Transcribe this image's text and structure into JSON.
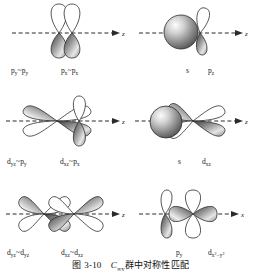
{
  "figure": {
    "caption_prefix": "图",
    "caption_number": "3-10",
    "caption_group": "C",
    "caption_group_sub": "∞v",
    "caption_text": "群中对称性匹配",
    "caption_full": "图 3-10  C∞v群中对称性匹配"
  },
  "colors": {
    "ink": "#1a1a1a",
    "outline": "#2b2b2b",
    "shade_dark": "#3a3a3a",
    "shade_mid": "#8d8d8d",
    "shade_light": "#e8e8e8",
    "sphere_dark": "#4a4a4a",
    "sphere_light": "#f2f2f2",
    "axis": "#2b2b2b",
    "background": "#ffffff"
  },
  "panels": [
    {
      "id": "panel-1",
      "row": 1,
      "col": 1,
      "axis_label": "z",
      "axis_style": "dashed-arrow-right",
      "orbitals": [
        "p_y vertical",
        "p_x vertical"
      ],
      "labels": [
        {
          "base": "p",
          "sub": "y",
          "tilde": "~",
          "base2": "p",
          "sub2": "y",
          "text": "py~py"
        },
        {
          "base": "p",
          "sub": "x",
          "tilde": "~",
          "base2": "p",
          "sub2": "x",
          "text": "px~px"
        }
      ],
      "label_texts": [
        "p",
        "y",
        "~",
        "p",
        "y",
        "p",
        "x",
        "~",
        "p",
        "x"
      ]
    },
    {
      "id": "panel-2",
      "row": 1,
      "col": 2,
      "axis_label": "z",
      "axis_style": "dashed-arrow-right",
      "orbitals": [
        "s sphere",
        "p_z tilted"
      ],
      "labels": [
        {
          "base": "s",
          "sub": "",
          "text": "s"
        },
        {
          "base": "p",
          "sub": "z",
          "text": "pz"
        }
      ]
    },
    {
      "id": "panel-3",
      "row": 2,
      "col": 1,
      "axis_label": "z",
      "axis_style": "dashed-arrow-right",
      "orbitals": [
        "d_yz four lobe",
        "p_y vertical"
      ],
      "labels": [
        {
          "base": "d",
          "sub": "yz",
          "tilde": "~",
          "base2": "p",
          "sub2": "y",
          "text": "dyz~py"
        },
        {
          "base": "d",
          "sub": "xz",
          "tilde": "~",
          "base2": "p",
          "sub2": "x",
          "text": "dxz~px"
        }
      ]
    },
    {
      "id": "panel-4",
      "row": 2,
      "col": 2,
      "axis_label": "z",
      "axis_style": "dashed-arrow-right",
      "orbitals": [
        "s sphere",
        "d_xz four lobe"
      ],
      "labels": [
        {
          "base": "s",
          "sub": "",
          "text": "s"
        },
        {
          "base": "d",
          "sub": "xz",
          "text": "dxz"
        }
      ]
    },
    {
      "id": "panel-5",
      "row": 3,
      "col": 1,
      "axis_label": "z",
      "axis_style": "dashed-arrow-right",
      "orbitals": [
        "d_yz four lobe",
        "d_yz four lobe"
      ],
      "labels": [
        {
          "base": "d",
          "sub": "yz",
          "tilde": "~",
          "base2": "d",
          "sub2": "yz",
          "text": "dyz~dyz"
        },
        {
          "base": "d",
          "sub": "xz",
          "tilde": "~",
          "base2": "d",
          "sub2": "xz",
          "text": "dxz~dxz"
        }
      ]
    },
    {
      "id": "panel-6",
      "row": 3,
      "col": 2,
      "axis_label": "x",
      "axis_style": "dashed-arrow-right",
      "orbitals": [
        "p_y vertical",
        "d_x2-y2 horizontal"
      ],
      "labels": [
        {
          "base": "p",
          "sub": "y",
          "text": "py"
        },
        {
          "base": "d",
          "sub": "x2-y2",
          "text": "dx2-y2"
        }
      ]
    }
  ],
  "labels_flat": {
    "p1a_base": "p",
    "p1a_sub": "y",
    "p1a_tilde": "~",
    "p1a_base2": "p",
    "p1a_sub2": "y",
    "p1b_base": "p",
    "p1b_sub": "x",
    "p1b_tilde": "~",
    "p1b_base2": "p",
    "p1b_sub2": "x",
    "p2a_base": "s",
    "p2b_base": "p",
    "p2b_sub": "z",
    "p3a_base": "d",
    "p3a_sub": "yz",
    "p3a_tilde": "~",
    "p3a_base2": "p",
    "p3a_sub2": "y",
    "p3b_base": "d",
    "p3b_sub": "xz",
    "p3b_tilde": "~",
    "p3b_base2": "p",
    "p3b_sub2": "x",
    "p4a_base": "s",
    "p4b_base": "d",
    "p4b_sub": "xz",
    "p5a_base": "d",
    "p5a_sub": "yz",
    "p5a_tilde": "~",
    "p5a_base2": "d",
    "p5a_sub2": "yz",
    "p5b_base": "d",
    "p5b_sub": "xz",
    "p5b_tilde": "~",
    "p5b_base2": "d",
    "p5b_sub2": "xz",
    "p6a_base": "p",
    "p6a_sub": "y",
    "p6b_base": "d",
    "p6b_sub_x": "x",
    "p6b_sup_x": "2",
    "p6b_dash": "−",
    "p6b_sub_y": "y",
    "p6b_sup_y": "2"
  },
  "axes": {
    "z": "z",
    "x": "x"
  }
}
